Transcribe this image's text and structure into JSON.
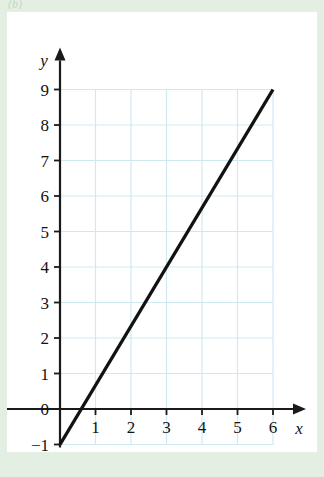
{
  "figure": {
    "panel_background": "#ffffff",
    "border_color": "#e3efe2",
    "top_fragment_text": "(b)"
  },
  "chart_data": {
    "type": "line",
    "title": "",
    "subtitle": "",
    "xlabel": "x",
    "ylabel": "y",
    "xlim": [
      0,
      6
    ],
    "ylim": [
      -1,
      9
    ],
    "grid": true,
    "grid_color": "#cfe9f2",
    "legend": "none",
    "line_color": "#121212",
    "axis_color": "#1a1a1a",
    "x_ticks": [
      1,
      2,
      3,
      4,
      5,
      6
    ],
    "x_tick_labels": [
      "1",
      "2",
      "3",
      "4",
      "5",
      "6"
    ],
    "y_ticks": [
      -1,
      0,
      1,
      2,
      3,
      4,
      5,
      6,
      7,
      8,
      9
    ],
    "y_tick_labels": [
      "−1",
      "0",
      "1",
      "2",
      "3",
      "4",
      "5",
      "6",
      "7",
      "8",
      "9"
    ],
    "series": [
      {
        "name": "line",
        "x": [
          0,
          6
        ],
        "y": [
          -1,
          9
        ],
        "slope": 1.6667,
        "intercept": -1,
        "x_intercept": 0.6
      }
    ],
    "annotations": []
  }
}
